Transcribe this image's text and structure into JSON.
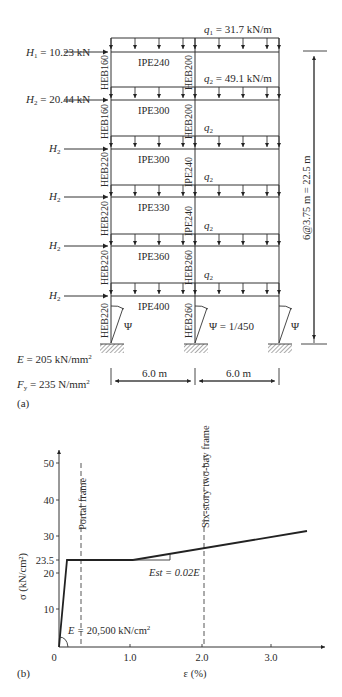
{
  "figure_a": {
    "label": "(a)",
    "loads": {
      "H1": "H",
      "H1_sub": "1",
      "H1_value": " = 10.23 kN",
      "H2": "H",
      "H2_sub": "2",
      "H2_value": " = 20.44 kN",
      "q1": "q",
      "q1_sub": "1",
      "q1_value": " = 31.7 kN/m",
      "q2": "q",
      "q2_sub": "2",
      "q2_value": " = 49.1 kN/m"
    },
    "beams": [
      "IPE240",
      "IPE300",
      "IPE300",
      "IPE330",
      "IPE360",
      "IPE400"
    ],
    "outer_columns": [
      "HEB160",
      "HEB160",
      "HEB220",
      "HEB220",
      "HEB220",
      "HEB220"
    ],
    "inner_columns": [
      "HEB200",
      "HEB200",
      "IPE240",
      "IPE240",
      "HEB260",
      "HEB260"
    ],
    "imperfection": {
      "symbol": "Ψ",
      "value_label": "Ψ = 1/450"
    },
    "height_dimension": "6@3.75 m = 22.5 m",
    "bay_dimensions": [
      "6.0 m",
      "6.0 m"
    ],
    "material": {
      "E_symbol": "E",
      "E_value": " = 205 kN/mm",
      "E_exp": "2",
      "Fy_symbol": "F",
      "Fy_sub": "y",
      "Fy_value": " = 235 N/mm",
      "Fy_exp": "2"
    }
  },
  "figure_b": {
    "label": "(b)",
    "annotations": {
      "portal": "Portal frame",
      "six_story": "Six-story two-bay frame",
      "est": "Est = 0.02E",
      "modulus_prefix": "E = ",
      "modulus_value": "20,500 kN/cm",
      "modulus_exp": "2"
    }
  },
  "chart_data": {
    "type": "line",
    "xlabel": "ε (%)",
    "ylabel": "σ (kN/cm²)",
    "x_ticks": [
      "0",
      "1.0",
      "2.0",
      "3.0"
    ],
    "y_ticks": [
      "10",
      "20",
      "23.5",
      "30",
      "40",
      "50"
    ],
    "xlim": [
      0,
      3.7
    ],
    "ylim": [
      0,
      55
    ],
    "series": [
      {
        "name": "Stress-strain curve",
        "x": [
          0,
          0.115,
          1.0,
          3.5
        ],
        "y": [
          0,
          23.5,
          23.5,
          31.5
        ]
      }
    ],
    "reference_lines": [
      {
        "x": 0.3,
        "label": "Portal frame",
        "style": "dashed"
      },
      {
        "x": 2.0,
        "label": "Six-story two-bay frame",
        "style": "dashed"
      }
    ],
    "annotations": [
      "E = 20,500 kN/cm²",
      "Est = 0.02E",
      "Yield stress 23.5 kN/cm²"
    ]
  }
}
